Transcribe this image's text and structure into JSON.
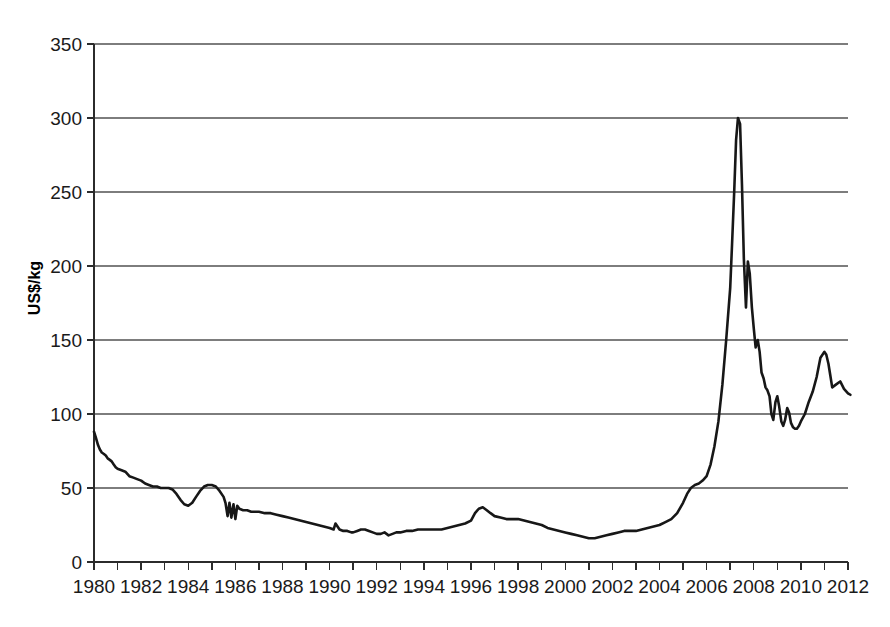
{
  "chart_data": {
    "type": "line",
    "title": "",
    "xlabel": "",
    "ylabel": "US$/kg",
    "xlim": [
      1980,
      2012
    ],
    "ylim": [
      0,
      350
    ],
    "grid": true,
    "legend": null,
    "y_ticks": [
      0,
      50,
      100,
      150,
      200,
      250,
      300,
      350
    ],
    "y_tick_labels": [
      "0",
      "50",
      "100",
      "150",
      "200",
      "250",
      "300",
      "350"
    ],
    "x_ticks": [
      1980,
      1981,
      1982,
      1983,
      1984,
      1985,
      1986,
      1987,
      1988,
      1989,
      1990,
      1991,
      1992,
      1993,
      1994,
      1995,
      1996,
      1997,
      1998,
      1999,
      2000,
      2001,
      2002,
      2003,
      2004,
      2005,
      2006,
      2007,
      2008,
      2009,
      2010,
      2011,
      2012
    ],
    "x_tick_labels": [
      "1980",
      "",
      "1982",
      "",
      "1984",
      "",
      "1986",
      "",
      "1988",
      "",
      "1990",
      "",
      "1992",
      "",
      "1994",
      "",
      "1996",
      "",
      "1998",
      "",
      "2000",
      "",
      "2002",
      "",
      "2004",
      "",
      "2006",
      "",
      "2008",
      "",
      "2010",
      "",
      "2012"
    ],
    "x_major_labels": [
      "1980",
      "1982",
      "1984",
      "1986",
      "1988",
      "1990",
      "1992",
      "1994",
      "1996",
      "1998",
      "2000",
      "2002",
      "2004",
      "2006",
      "2008",
      "2010",
      "2012"
    ],
    "series": [
      {
        "name": "Price",
        "color": "#171717",
        "x": [
          1980.0,
          1980.08,
          1980.17,
          1980.25,
          1980.33,
          1980.42,
          1980.5,
          1980.58,
          1980.67,
          1980.75,
          1980.83,
          1980.92,
          1981.0,
          1981.17,
          1981.33,
          1981.5,
          1981.67,
          1981.83,
          1982.0,
          1982.17,
          1982.33,
          1982.5,
          1982.67,
          1982.83,
          1983.0,
          1983.17,
          1983.33,
          1983.5,
          1983.67,
          1983.83,
          1984.0,
          1984.17,
          1984.33,
          1984.5,
          1984.67,
          1984.83,
          1985.0,
          1985.17,
          1985.33,
          1985.5,
          1985.58,
          1985.67,
          1985.75,
          1985.83,
          1985.92,
          1986.0,
          1986.08,
          1986.17,
          1986.33,
          1986.5,
          1986.67,
          1986.83,
          1987.0,
          1987.25,
          1987.5,
          1987.75,
          1988.0,
          1988.25,
          1988.5,
          1988.75,
          1989.0,
          1989.25,
          1989.5,
          1989.75,
          1990.0,
          1990.17,
          1990.25,
          1990.42,
          1990.58,
          1990.75,
          1990.92,
          1991.0,
          1991.17,
          1991.33,
          1991.5,
          1991.67,
          1991.83,
          1992.0,
          1992.17,
          1992.33,
          1992.5,
          1992.67,
          1992.83,
          1993.0,
          1993.25,
          1993.5,
          1993.75,
          1994.0,
          1994.25,
          1994.5,
          1994.75,
          1995.0,
          1995.25,
          1995.5,
          1995.75,
          1996.0,
          1996.17,
          1996.33,
          1996.5,
          1996.67,
          1996.83,
          1997.0,
          1997.25,
          1997.5,
          1997.75,
          1998.0,
          1998.25,
          1998.5,
          1998.75,
          1999.0,
          1999.25,
          1999.5,
          1999.75,
          2000.0,
          2000.25,
          2000.5,
          2000.75,
          2001.0,
          2001.25,
          2001.5,
          2001.75,
          2002.0,
          2002.25,
          2002.5,
          2002.75,
          2003.0,
          2003.25,
          2003.5,
          2003.75,
          2004.0,
          2004.25,
          2004.5,
          2004.75,
          2005.0,
          2005.17,
          2005.33,
          2005.5,
          2005.67,
          2005.83,
          2006.0,
          2006.17,
          2006.33,
          2006.5,
          2006.67,
          2006.83,
          2007.0,
          2007.08,
          2007.17,
          2007.25,
          2007.33,
          2007.42,
          2007.5,
          2007.58,
          2007.67,
          2007.75,
          2007.83,
          2007.92,
          2008.0,
          2008.08,
          2008.17,
          2008.25,
          2008.33,
          2008.42,
          2008.5,
          2008.58,
          2008.67,
          2008.75,
          2008.83,
          2008.92,
          2009.0,
          2009.08,
          2009.17,
          2009.25,
          2009.33,
          2009.42,
          2009.5,
          2009.58,
          2009.67,
          2009.75,
          2009.83,
          2009.92,
          2010.0,
          2010.17,
          2010.33,
          2010.5,
          2010.67,
          2010.83,
          2011.0,
          2011.08,
          2011.17,
          2011.25,
          2011.33,
          2011.5,
          2011.67,
          2011.83,
          2012.0,
          2012.1
        ],
        "y": [
          88,
          84,
          79,
          76,
          74,
          73,
          72,
          70,
          69,
          68,
          66,
          64,
          63,
          62,
          61,
          58,
          57,
          56,
          55,
          53,
          52,
          51,
          51,
          50,
          50,
          50,
          49,
          46,
          42,
          39,
          38,
          40,
          44,
          48,
          51,
          52,
          52,
          51,
          48,
          44,
          40,
          31,
          40,
          30,
          39,
          29,
          38,
          36,
          35,
          35,
          34,
          34,
          34,
          33,
          33,
          32,
          31,
          30,
          29,
          28,
          27,
          26,
          25,
          24,
          23,
          22,
          26,
          22,
          21,
          21,
          20,
          20,
          21,
          22,
          22,
          21,
          20,
          19,
          19,
          20,
          18,
          19,
          20,
          20,
          21,
          21,
          22,
          22,
          22,
          22,
          22,
          23,
          24,
          25,
          26,
          28,
          33,
          36,
          37,
          35,
          33,
          31,
          30,
          29,
          29,
          29,
          28,
          27,
          26,
          25,
          23,
          22,
          21,
          20,
          19,
          18,
          17,
          16,
          16,
          17,
          18,
          19,
          20,
          21,
          21,
          21,
          22,
          23,
          24,
          25,
          27,
          29,
          33,
          40,
          46,
          50,
          52,
          53,
          55,
          58,
          66,
          78,
          95,
          120,
          150,
          185,
          215,
          250,
          285,
          300,
          296,
          255,
          205,
          172,
          203,
          195,
          172,
          158,
          145,
          150,
          142,
          128,
          124,
          118,
          116,
          112,
          100,
          96,
          108,
          112,
          105,
          95,
          92,
          96,
          104,
          101,
          94,
          91,
          90,
          90,
          92,
          95,
          100,
          108,
          115,
          125,
          138,
          142,
          140,
          134,
          126,
          118,
          120,
          122,
          117,
          114,
          113
        ]
      }
    ]
  },
  "axes": {
    "y_axis_title": "US$/kg"
  }
}
